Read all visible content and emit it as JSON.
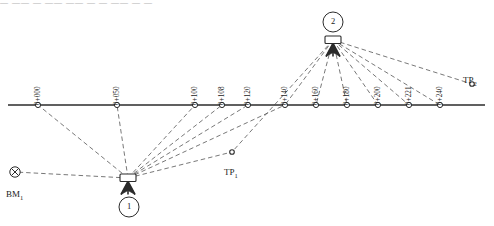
{
  "title_fragment": {
    "text": "— —— — —— —— — — —— — —",
    "note": "clipped illegible header line"
  },
  "baseline": {
    "y": 105,
    "x_start": 8,
    "x_end": 485
  },
  "stations": [
    {
      "label": "0+000",
      "x": 38,
      "y": 105
    },
    {
      "label": "0+050",
      "x": 117,
      "y": 105
    },
    {
      "label": "0+100",
      "x": 195,
      "y": 105
    },
    {
      "label": "0+108",
      "x": 222,
      "y": 105
    },
    {
      "label": "0+120",
      "x": 248,
      "y": 105
    },
    {
      "label": "0+140",
      "x": 285,
      "y": 105
    },
    {
      "label": "0+160",
      "x": 316,
      "y": 105
    },
    {
      "label": "0+180",
      "x": 347,
      "y": 105
    },
    {
      "label": "0+200",
      "x": 378,
      "y": 105
    },
    {
      "label": "0+221",
      "x": 409,
      "y": 105
    },
    {
      "label": "0+240",
      "x": 440,
      "y": 105
    }
  ],
  "instruments": [
    {
      "id": "1",
      "label": "1",
      "x": 128,
      "y": 178,
      "circle_x": 129,
      "circle_y": 207
    },
    {
      "id": "2",
      "label": "2",
      "x": 333,
      "y": 40,
      "circle_x": 333,
      "circle_y": 22
    }
  ],
  "benchmarks": [
    {
      "name": "BM",
      "sub": "1",
      "label": "BM₁",
      "x": 15,
      "y": 172,
      "label_x": 6,
      "label_y": 190
    }
  ],
  "turning_points": [
    {
      "name": "TP",
      "sub": "1",
      "label": "TP₁",
      "x": 232,
      "y": 152,
      "label_x": 224,
      "label_y": 168
    },
    {
      "name": "TP",
      "sub": "2",
      "label": "TP₂",
      "x": 472,
      "y": 84,
      "label_x": 463,
      "label_y": 76
    }
  ],
  "sightlines": {
    "from_station_1": [
      "BM₁",
      "0+000",
      "0+050",
      "0+100",
      "0+108",
      "0+120",
      "0+140",
      "TP₁"
    ],
    "from_station_2": [
      "TP₁",
      "0+140",
      "0+160",
      "0+180",
      "0+200",
      "0+221",
      "0+240",
      "TP₂"
    ]
  },
  "colors": {
    "ink": "#1a1a1a",
    "line": "#2b2b2b",
    "dash": "#555555",
    "background": "#ffffff"
  }
}
